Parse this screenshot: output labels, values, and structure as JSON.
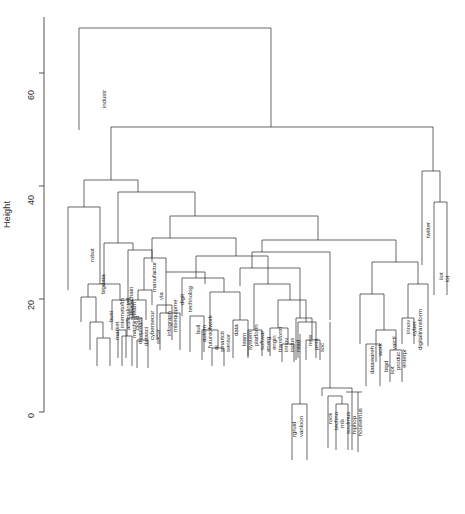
{
  "figure": {
    "type": "dendrogram",
    "ylabel": "Height",
    "xlabel": "",
    "title": ""
  },
  "axis": {
    "ticks": [
      "0",
      "20",
      "40",
      "60"
    ],
    "tick_values": [
      0,
      20,
      40,
      60
    ],
    "range": [
      0,
      70
    ]
  },
  "chart_data": {
    "type": "dendrogram",
    "title": "",
    "xlabel": "",
    "ylabel": "Height",
    "ylim": [
      0,
      70
    ],
    "yticks": [
      0,
      20,
      40,
      60
    ],
    "grid": false,
    "legend": "none",
    "n_leaves": 58,
    "leaves": [
      "industr",
      "robot",
      "bigdata",
      "busi",
      "market",
      "internetofth",
      "artificialintell",
      "machinelearn",
      "deeplearn",
      "datasci",
      "blockchain",
      "cloud",
      "iiot",
      "cybersecur",
      "secur",
      "manufactur",
      "via",
      "infograph",
      "misequipme",
      "digit",
      "technolog",
      "buil",
      "autom",
      "futureofwork",
      "ai",
      "smartcit",
      "sensor",
      "data",
      "learn",
      "system",
      "platform",
      "softwar",
      "energ",
      "engin",
      "transform",
      "innov",
      "indus",
      "read",
      "new",
      "print",
      "soc",
      "rgruid",
      "vanloon",
      "rock",
      "techno",
      "rnb",
      "soulmus",
      "hiphop",
      "housemus",
      "datawareh",
      "work",
      "bigd",
      "iiot",
      "produc",
      "enterpr",
      "vaictl",
      "innov",
      "cyber",
      "digitaltransform",
      "twitter",
      "iiot",
      "iot"
    ],
    "merges": [
      {
        "height": 68.0,
        "label": "root",
        "children": [
          "industr",
          "rest"
        ]
      },
      {
        "height": 50.5,
        "label": "n2",
        "children": [
          "main-block",
          "twitter-iot"
        ]
      },
      {
        "height": 45.5,
        "label": "twitter-iot",
        "children": [
          "twitter",
          "iot-pair"
        ]
      },
      {
        "height": 38.5,
        "label": "main-block",
        "children": [
          "robot-sub",
          "tech-sub"
        ]
      },
      {
        "height": 35.5,
        "label": "robot-sub",
        "children": [
          "robot",
          "busi-cluster"
        ]
      },
      {
        "height": 29.0,
        "label": "tech-sub",
        "children": [
          "manufactur-grp",
          "big-right"
        ]
      },
      {
        "height": 26.0,
        "label": "busi-cluster",
        "children": [
          "bigdata-grp",
          "ml-grp"
        ]
      },
      {
        "height": 25.5,
        "label": "big-right",
        "children": [
          "digit-grp",
          "right-grp"
        ]
      },
      {
        "height": 24.0,
        "label": "iot-pair",
        "children": [
          "iiot",
          "iot"
        ]
      },
      {
        "height": 23.0,
        "label": "manufactur-grp",
        "children": [
          "manufactur",
          "via"
        ]
      },
      {
        "height": 22.0,
        "label": "digit-grp",
        "children": [
          "technolog",
          "cluster-a"
        ]
      },
      {
        "height": 21.0,
        "label": "ml-grp",
        "children": [
          "artificialintell",
          "machinelearn"
        ]
      },
      {
        "height": 19.0,
        "label": "cluster-a",
        "children": [
          "buil-grp",
          "data-grp"
        ]
      },
      {
        "height": 17.0,
        "label": "right-grp",
        "children": [
          "work-grp",
          "digitaltransform"
        ]
      },
      {
        "height": 15.0,
        "label": "music-grp",
        "children": [
          "rock",
          "techno"
        ]
      },
      {
        "height": 12.0,
        "label": "data-grp",
        "children": [
          "data",
          "platform"
        ]
      },
      {
        "height": 8.0,
        "label": "rgruid-grp",
        "children": [
          "rgruid",
          "vanloon"
        ]
      },
      {
        "height": 6.5,
        "label": "soul-grp",
        "children": [
          "soulmus",
          "hiphop"
        ]
      }
    ]
  },
  "leaf_labels": [
    {
      "t": "industr",
      "x": 100,
      "y": 108,
      "h": 62.0
    },
    {
      "t": "robot",
      "x": 88,
      "y": 262,
      "h": 33.0
    },
    {
      "t": "bigdata",
      "x": 99,
      "y": 294,
      "h": 20.0
    },
    {
      "t": "busi",
      "x": 107,
      "y": 322,
      "h": 14.5
    },
    {
      "t": "market",
      "x": 113,
      "y": 340,
      "h": 10.0
    },
    {
      "t": "internetofth",
      "x": 118,
      "y": 328,
      "h": 11.0
    },
    {
      "t": "artificialintell",
      "x": 124,
      "y": 330,
      "h": 9.0
    },
    {
      "t": "machinelearn",
      "x": 130,
      "y": 338,
      "h": 8.5
    },
    {
      "t": "deeplearn",
      "x": 136,
      "y": 344,
      "h": 8.0
    },
    {
      "t": "datasci",
      "x": 142,
      "y": 346,
      "h": 9.5
    },
    {
      "t": "blockchain",
      "x": 127,
      "y": 315,
      "h": 13.0
    },
    {
      "t": "cloud",
      "x": 133,
      "y": 330,
      "h": 11.0
    },
    {
      "t": "cybersecur",
      "x": 148,
      "y": 340,
      "h": 10.0
    },
    {
      "t": "secur",
      "x": 154,
      "y": 344,
      "h": 9.5
    },
    {
      "t": "manufactur",
      "x": 150,
      "y": 292,
      "h": 20.0
    },
    {
      "t": "via",
      "x": 157,
      "y": 300,
      "h": 18.0
    },
    {
      "t": "infograph",
      "x": 165,
      "y": 336,
      "h": 12.0
    },
    {
      "t": "misequipme",
      "x": 171,
      "y": 332,
      "h": 12.5
    },
    {
      "t": "digit",
      "x": 178,
      "y": 305,
      "h": 17.0
    },
    {
      "t": "technolog",
      "x": 186,
      "y": 312,
      "h": 16.5
    },
    {
      "t": "buil",
      "x": 194,
      "y": 334,
      "h": 12.0
    },
    {
      "t": "autom",
      "x": 200,
      "y": 342,
      "h": 10.0
    },
    {
      "t": "futureofwork",
      "x": 206,
      "y": 348,
      "h": 9.0
    },
    {
      "t": "ai",
      "x": 212,
      "y": 350,
      "h": 8.5
    },
    {
      "t": "smartcit",
      "x": 218,
      "y": 352,
      "h": 8.0
    },
    {
      "t": "sensor",
      "x": 224,
      "y": 352,
      "h": 8.0
    },
    {
      "t": "data",
      "x": 232,
      "y": 336,
      "h": 12.0
    },
    {
      "t": "learn",
      "x": 240,
      "y": 346,
      "h": 9.5
    },
    {
      "t": "system",
      "x": 246,
      "y": 350,
      "h": 9.0
    },
    {
      "t": "platform",
      "x": 252,
      "y": 346,
      "h": 9.5
    },
    {
      "t": "softwar",
      "x": 258,
      "y": 350,
      "h": 8.5
    },
    {
      "t": "energ",
      "x": 264,
      "y": 352,
      "h": 8.0
    },
    {
      "t": "engin",
      "x": 270,
      "y": 350,
      "h": 8.5
    },
    {
      "t": "transform",
      "x": 276,
      "y": 352,
      "h": 8.0
    },
    {
      "t": "innov",
      "x": 282,
      "y": 352,
      "h": 8.0
    },
    {
      "t": "indus",
      "x": 288,
      "y": 352,
      "h": 8.0
    },
    {
      "t": "read",
      "x": 294,
      "y": 352,
      "h": 7.5
    },
    {
      "t": "new",
      "x": 306,
      "y": 346,
      "h": 9.0
    },
    {
      "t": "print",
      "x": 312,
      "y": 350,
      "h": 8.0
    },
    {
      "t": "soc",
      "x": 318,
      "y": 352,
      "h": 7.5
    },
    {
      "t": "rgruid",
      "x": 290,
      "y": 437,
      "h": 1.5
    },
    {
      "t": "vanloon",
      "x": 297,
      "y": 437,
      "h": 1.5
    },
    {
      "t": "rock",
      "x": 326,
      "y": 424,
      "h": 3.0
    },
    {
      "t": "techno",
      "x": 332,
      "y": 430,
      "h": 2.5
    },
    {
      "t": "rnb",
      "x": 338,
      "y": 428,
      "h": 2.5
    },
    {
      "t": "soulmus",
      "x": 344,
      "y": 434,
      "h": 2.0
    },
    {
      "t": "hiphop",
      "x": 350,
      "y": 434,
      "h": 2.0
    },
    {
      "t": "housemus",
      "x": 356,
      "y": 436,
      "h": 1.8
    },
    {
      "t": "datawareh",
      "x": 368,
      "y": 374,
      "h": 5.0
    },
    {
      "t": "work",
      "x": 376,
      "y": 356,
      "h": 7.5
    },
    {
      "t": "bigd",
      "x": 382,
      "y": 372,
      "h": 5.0
    },
    {
      "t": "iiot",
      "x": 388,
      "y": 374,
      "h": 4.5
    },
    {
      "t": "produc",
      "x": 394,
      "y": 370,
      "h": 5.0
    },
    {
      "t": "enterpr",
      "x": 400,
      "y": 368,
      "h": 5.5
    },
    {
      "t": "vaictl",
      "x": 390,
      "y": 350,
      "h": 9.0
    },
    {
      "t": "innov",
      "x": 404,
      "y": 334,
      "h": 13.0
    },
    {
      "t": "cyber",
      "x": 410,
      "y": 336,
      "h": 12.5
    },
    {
      "t": "digitaltransform",
      "x": 416,
      "y": 350,
      "h": 11.0
    },
    {
      "t": "twitter",
      "x": 424,
      "y": 238,
      "h": 27.0
    },
    {
      "t": "iiot",
      "x": 437,
      "y": 280,
      "h": 20.0
    },
    {
      "t": "iot",
      "x": 443,
      "y": 282,
      "h": 20.0
    }
  ]
}
